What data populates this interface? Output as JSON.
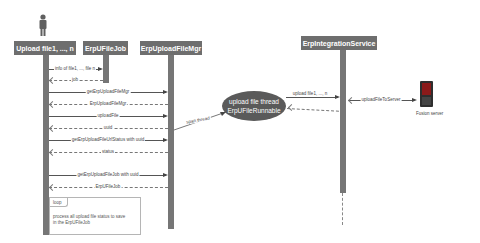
{
  "actors": [
    {
      "id": "uploader",
      "label": "Upload file1, ..., n",
      "has_person_icon": true
    },
    {
      "id": "job",
      "label": "ErpUFileJob"
    },
    {
      "id": "mgr",
      "label": "ErpUploadFileMgr"
    },
    {
      "id": "service",
      "label": "ErpIntegrationService"
    }
  ],
  "thread": {
    "line1": "upload file thread",
    "line2": "ErpUFileRunnable"
  },
  "messages": [
    {
      "label": "info of file1, ..., file n",
      "type": "sync"
    },
    {
      "label": "job",
      "type": "return"
    },
    {
      "label": "getErpUploadFileMgr",
      "type": "sync"
    },
    {
      "label": "ErpUploadFileMgr",
      "type": "return"
    },
    {
      "label": "uploadFile",
      "type": "sync"
    },
    {
      "label": "uuid",
      "type": "return"
    },
    {
      "label": "getErpUploadFileUrlStatus with uuid",
      "type": "sync"
    },
    {
      "label": "status",
      "type": "return"
    },
    {
      "label": "getErpUploadFileJob with uuid",
      "type": "sync"
    },
    {
      "label": "ErpUFileJob",
      "type": "return"
    },
    {
      "label": "span thread",
      "type": "sync"
    },
    {
      "label": "upload file1, ..., n",
      "type": "sync"
    },
    {
      "label": "uploadFileToServer",
      "type": "sync"
    }
  ],
  "note": {
    "tab": "loop",
    "line1": "process all upload file status to save",
    "line2": "in the ErpUFileJob"
  },
  "server": {
    "label": "Fusion server",
    "icon": "server-icon"
  },
  "colors": {
    "actor_fill": "#6e6e6e",
    "lifeline": "#767676",
    "ellipse": "#5a5a5a",
    "server": "#8b1a1a"
  }
}
